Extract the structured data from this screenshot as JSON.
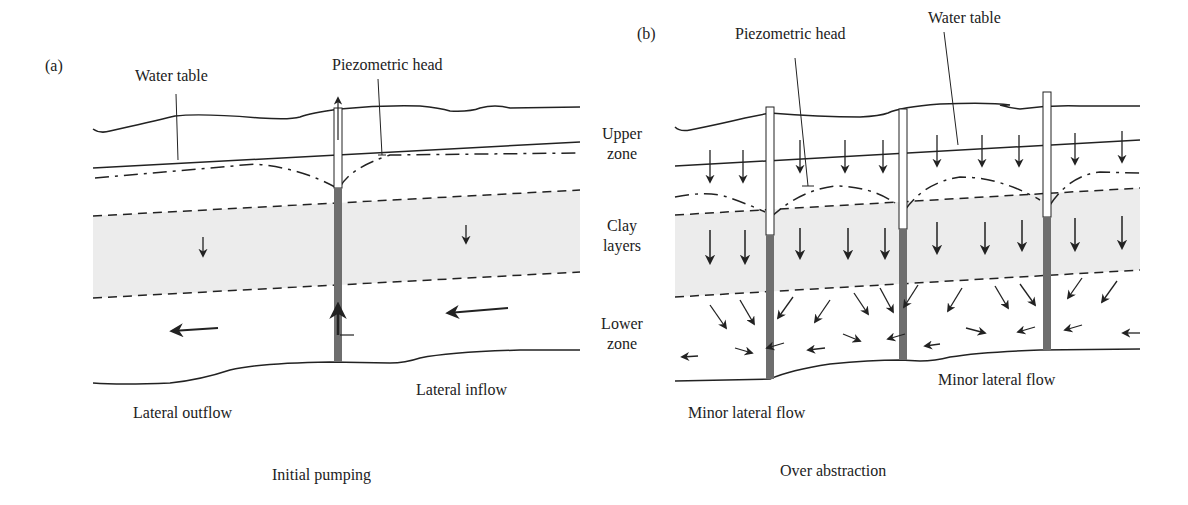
{
  "panel_a": {
    "tag": "(a)",
    "water_table_label": "Water table",
    "piezometric_head_label": "Piezometric head",
    "lateral_outflow_label": "Lateral outflow",
    "lateral_inflow_label": "Lateral inflow",
    "caption": "Initial pumping"
  },
  "panel_b": {
    "tag": "(b)",
    "piezometric_head_label": "Piezometric head",
    "water_table_label": "Water table",
    "minor_lateral_flow_left": "Minor lateral flow",
    "minor_lateral_flow_right": "Minor lateral flow",
    "caption": "Over abstraction"
  },
  "zones": {
    "upper_line1": "Upper",
    "upper_line2": "zone",
    "clay_line1": "Clay",
    "clay_line2": "layers",
    "lower_line1": "Lower",
    "lower_line2": "zone"
  },
  "colors": {
    "line": "#222222",
    "clay_fill": "#ececec",
    "well_screen": "#6e6e6e"
  }
}
